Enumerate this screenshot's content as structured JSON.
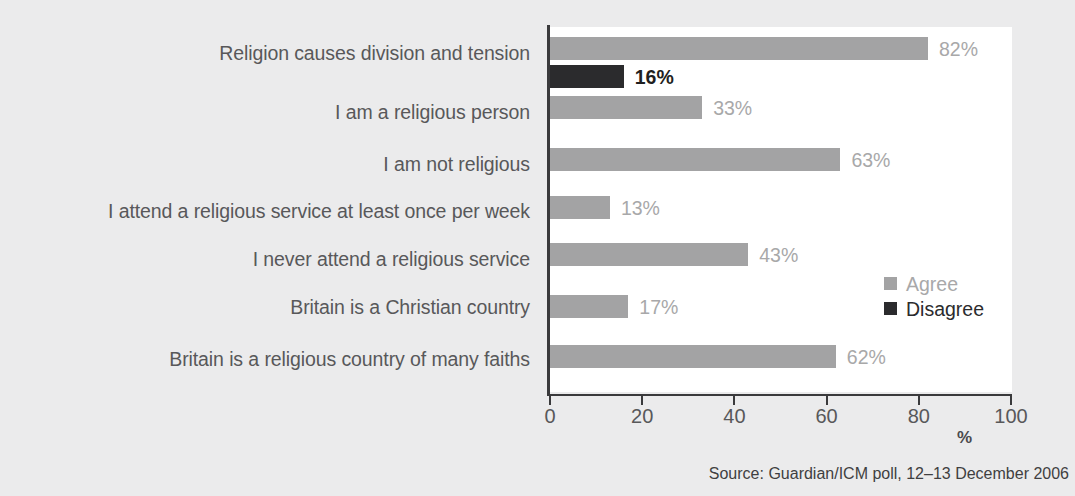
{
  "chart_data": {
    "type": "bar",
    "orientation": "horizontal",
    "title": "",
    "subtitle": "",
    "xlabel": "%",
    "ylabel": "",
    "xlim": [
      0,
      100
    ],
    "xticks": [
      0,
      20,
      40,
      60,
      80,
      100
    ],
    "grid": false,
    "legend_position": "inside-right",
    "categories": [
      "Religion causes division and tension",
      "I am a religious person",
      "I am not religious",
      "I attend a religious service at least once per week",
      "I never attend a religious service",
      "Britain is a Christian country",
      "Britain is a religious country of many faiths"
    ],
    "series": [
      {
        "name": "Agree",
        "color": "#a3a3a4",
        "values": [
          82,
          33,
          63,
          13,
          43,
          17,
          62
        ]
      },
      {
        "name": "Disagree",
        "color": "#2b2b2d",
        "values": [
          16,
          null,
          null,
          null,
          null,
          null,
          null
        ]
      }
    ],
    "bars": [
      {
        "category": "Religion causes division and tension",
        "series": "Agree",
        "value": 82,
        "label": "82%"
      },
      {
        "category": "Religion causes division and tension",
        "series": "Disagree",
        "value": 16,
        "label": "16%"
      },
      {
        "category": "I am a religious person",
        "series": "Agree",
        "value": 33,
        "label": "33%"
      },
      {
        "category": "I am not religious",
        "series": "Agree",
        "value": 63,
        "label": "63%"
      },
      {
        "category": "I attend a religious service at least once per week",
        "series": "Agree",
        "value": 13,
        "label": "13%"
      },
      {
        "category": "I never attend a religious service",
        "series": "Agree",
        "value": 43,
        "label": "43%"
      },
      {
        "category": "Britain is a Christian country",
        "series": "Agree",
        "value": 17,
        "label": "17%"
      },
      {
        "category": "Britain is a religious country of many faiths",
        "series": "Agree",
        "value": 62,
        "label": "62%"
      }
    ],
    "annotations": []
  },
  "axis": {
    "tick_labels": [
      "0",
      "20",
      "40",
      "60",
      "80",
      "100"
    ],
    "unit_label": "%"
  },
  "legend": {
    "items": [
      {
        "label": "Agree",
        "color": "#a3a3a4"
      },
      {
        "label": "Disagree",
        "color": "#2b2b2d"
      }
    ]
  },
  "source": {
    "text": "Source: Guardian/ICM poll, 12–13 December 2006"
  },
  "colors": {
    "background": "#ebebec",
    "plot_background": "#ffffff",
    "axis": "#3a3a3c",
    "agree": "#a3a3a4",
    "disagree": "#2b2b2d",
    "label_text": "#58585a"
  }
}
